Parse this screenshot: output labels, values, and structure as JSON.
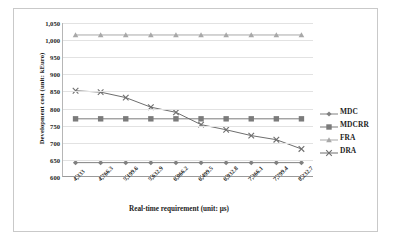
{
  "chart_data": {
    "type": "line",
    "title": "",
    "xlabel": "Real-time requirement (unit: μs)",
    "ylabel": "Development cost (unit: kEuro)",
    "categories": [
      "4,333",
      "4,766.3",
      "5,199.6",
      "5,632.9",
      "6,066.2",
      "6,499.5",
      "6,932.8",
      "7,366.1",
      "7,799.4",
      "8,232.7"
    ],
    "ylim": [
      600,
      1050
    ],
    "yticks": [
      "600",
      "650",
      "700",
      "750",
      "800",
      "850",
      "900",
      "950",
      "1,000",
      "1,050"
    ],
    "ytick_values": [
      600,
      650,
      700,
      750,
      800,
      850,
      900,
      950,
      1000,
      1050
    ],
    "grid": true,
    "legend_position": "right",
    "series": [
      {
        "name": "MDC",
        "marker": "diamond",
        "color": "#808080",
        "values": [
          642,
          642,
          642,
          642,
          642,
          642,
          642,
          642,
          642,
          642
        ]
      },
      {
        "name": "MDCRR",
        "marker": "square",
        "color": "#7b7b7b",
        "values": [
          770,
          770,
          770,
          770,
          770,
          770,
          770,
          770,
          770,
          770
        ]
      },
      {
        "name": "FRA",
        "marker": "triangle",
        "color": "#a8a8a8",
        "values": [
          1015,
          1015,
          1015,
          1015,
          1015,
          1015,
          1015,
          1015,
          1015,
          1015
        ]
      },
      {
        "name": "DRA",
        "marker": "x",
        "color": "#6e6e6e",
        "values": [
          852,
          848,
          832,
          804,
          789,
          753,
          738,
          721,
          709,
          682
        ]
      }
    ]
  },
  "colors": {
    "grid": "#e2e2e2",
    "axis": "#9a9a9a",
    "border": "#c9c9c9",
    "text": "#1d1d1d",
    "background": "#ffffff"
  }
}
